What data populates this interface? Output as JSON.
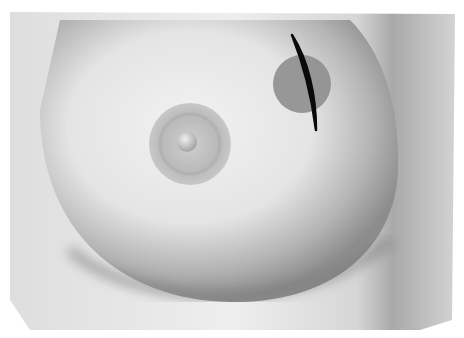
{
  "illustration": {
    "subject": "breast anatomy illustration with marked lesion and incision line",
    "background_color": "#ffffff",
    "panel_color": "#e6e6e6",
    "skin_light": "#ececec",
    "skin_shadow": "#8a8a8a",
    "areola_color": "#bdbdbd",
    "nipple_color": "#d8d8d8",
    "lesion": {
      "shape": "circle",
      "cx": 302,
      "cy": 84,
      "r": 29,
      "color": "#8e8e8e"
    },
    "incision": {
      "shape": "curved-line",
      "color": "#0a0a0a",
      "from": [
        292,
        35
      ],
      "to": [
        316,
        130
      ]
    }
  }
}
